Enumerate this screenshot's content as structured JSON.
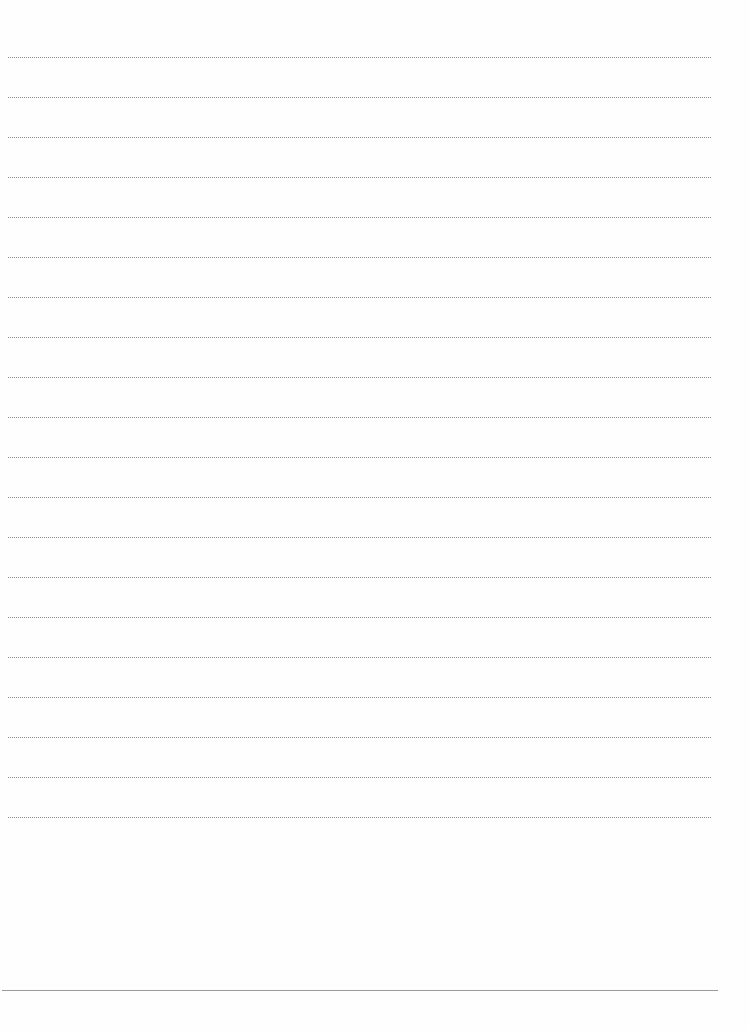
{
  "page": {
    "type": "lined-paper",
    "background_color": "#fefefe",
    "rule_color": "#8a8a8a",
    "rule_style": "dotted",
    "rule_count": 20,
    "first_rule_y": 57,
    "rule_spacing": 40,
    "bottom_rule": {
      "style": "solid",
      "color": "#9a9a9a",
      "y": 990
    },
    "text_content": ""
  }
}
